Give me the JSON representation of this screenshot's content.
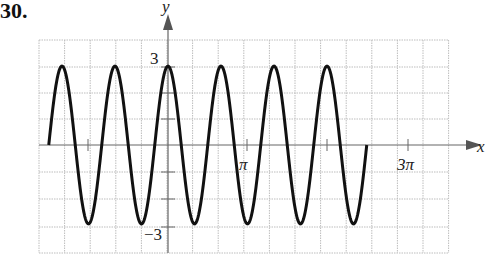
{
  "problem_number": "30.",
  "chart_data": {
    "type": "line",
    "title": "",
    "function": "y = 3 cos(3x)",
    "xlabel": "x",
    "ylabel": "y",
    "x_ticks": [
      {
        "value": "pi",
        "label": "π"
      },
      {
        "value": "3pi",
        "label": "3π"
      }
    ],
    "y_ticks": [
      {
        "value": 3,
        "label": "3"
      },
      {
        "value": -3,
        "label": "−3"
      }
    ],
    "x_domain": [
      "-3π/2",
      "5π/2"
    ],
    "ylim": [
      -3.9,
      4.4
    ],
    "amplitude": 3,
    "period": "2π/3",
    "grid": true,
    "series": [
      {
        "name": "y = 3cos(3x)",
        "color": "#111111"
      }
    ]
  },
  "labels": {
    "x_axis": "x",
    "y_axis": "y",
    "pi": "π",
    "three_pi": "3π",
    "y_max": "3",
    "y_min": "−3"
  }
}
